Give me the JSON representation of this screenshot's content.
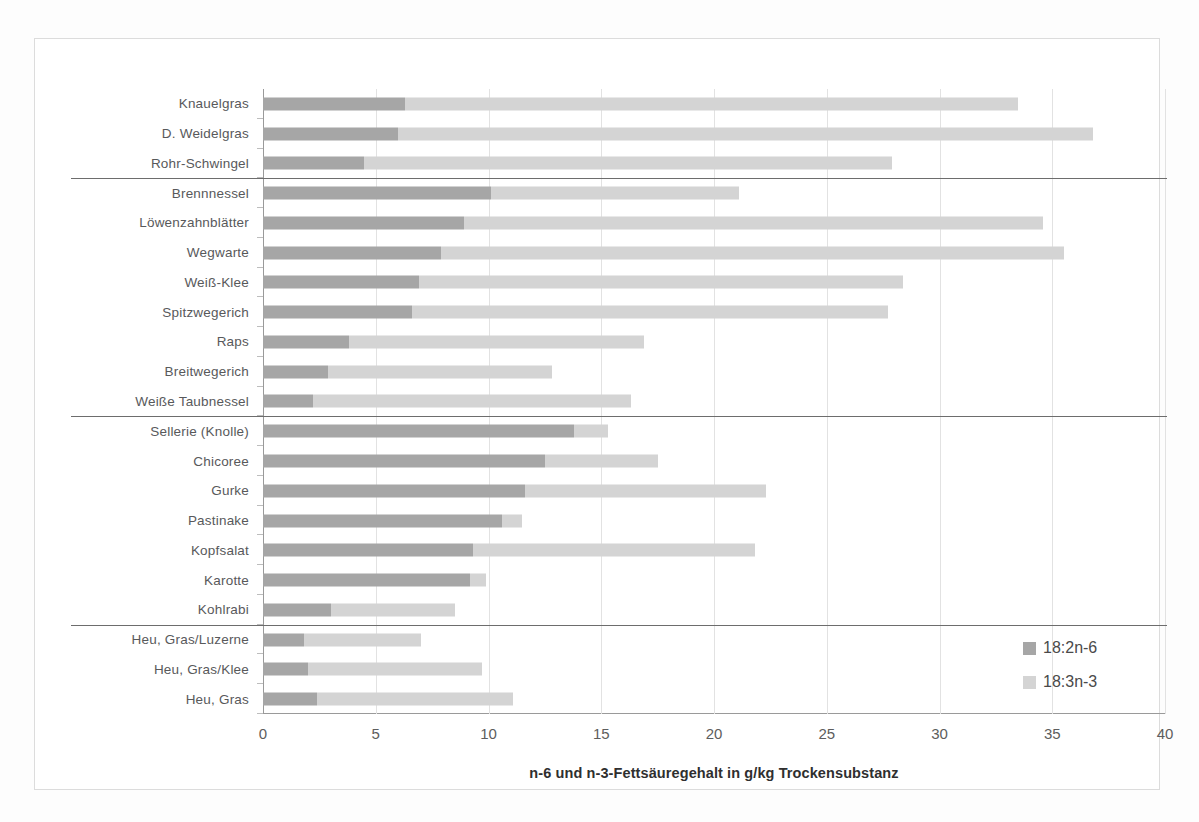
{
  "chart_data": {
    "type": "bar",
    "orientation": "horizontal",
    "stacked": true,
    "title": "",
    "xlabel": "n-6 und n-3-Fettsäuregehalt in g/kg Trockensubstanz",
    "ylabel": "",
    "xlim": [
      0,
      40
    ],
    "xticks": [
      0,
      5,
      10,
      15,
      20,
      25,
      30,
      35,
      40
    ],
    "xtick_labels": [
      "0",
      "5",
      "10",
      "15",
      "20",
      "25",
      "30",
      "35",
      "40"
    ],
    "grid": true,
    "legend_position": "bottom-right",
    "colors": {
      "18:2n-6": "#a6a6a6",
      "18:3n-3": "#d4d4d4"
    },
    "categories": [
      "Knauelgras",
      "D. Weidelgras",
      "Rohr-Schwingel",
      "Brennnessel",
      "Löwenzahnblätter",
      "Wegwarte",
      "Weiß-Klee",
      "Spitzwegerich",
      "Raps",
      "Breitwegerich",
      "Weiße Taubnessel",
      "Sellerie (Knolle)",
      "Chicoree",
      "Gurke",
      "Pastinake",
      "Kopfsalat",
      "Karotte",
      "Kohlrabi",
      "Heu, Gras/Luzerne",
      "Heu, Gras/Klee",
      "Heu, Gras"
    ],
    "series": [
      {
        "name": "18:2n-6",
        "values": [
          6.3,
          6.0,
          4.5,
          10.1,
          8.9,
          7.9,
          6.9,
          6.6,
          3.8,
          2.9,
          2.2,
          13.8,
          12.5,
          11.6,
          10.6,
          9.3,
          9.2,
          3.0,
          1.8,
          2.0,
          2.4
        ]
      },
      {
        "name": "18:3n-3",
        "values": [
          27.2,
          30.8,
          23.4,
          11.0,
          25.7,
          27.6,
          21.5,
          21.1,
          13.1,
          9.9,
          14.1,
          1.5,
          5.0,
          10.7,
          0.9,
          12.5,
          0.7,
          5.5,
          5.2,
          7.7,
          8.7
        ]
      }
    ],
    "totals": [
      33.5,
      36.8,
      27.9,
      21.1,
      34.6,
      35.5,
      28.4,
      27.7,
      16.9,
      12.8,
      16.3,
      15.3,
      17.5,
      22.3,
      11.5,
      21.8,
      9.9,
      8.5,
      7.0,
      9.7,
      11.1
    ],
    "group_separators_after": [
      2,
      10,
      17
    ],
    "groups": [
      {
        "rows": [
          0,
          1,
          2
        ]
      },
      {
        "rows": [
          3,
          4,
          5,
          6,
          7,
          8,
          9,
          10
        ]
      },
      {
        "rows": [
          11,
          12,
          13,
          14,
          15,
          16,
          17
        ]
      },
      {
        "rows": [
          18,
          19,
          20
        ]
      }
    ]
  },
  "legend": {
    "items": [
      {
        "label": "18:2n-6",
        "color": "#a6a6a6"
      },
      {
        "label": "18:3n-3",
        "color": "#d4d4d4"
      }
    ]
  }
}
